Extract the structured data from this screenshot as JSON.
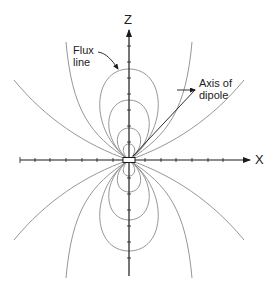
{
  "figure": {
    "axes": {
      "x_label": "X",
      "z_label": "Z"
    },
    "annotations": {
      "flux_line": [
        "Flux",
        "line"
      ],
      "axis_of_dipole": [
        "Axis of",
        "dipole"
      ]
    },
    "colors": {
      "axis": "#1a1a1a",
      "field_line": "#8a8a8a",
      "text": "#222222"
    }
  }
}
